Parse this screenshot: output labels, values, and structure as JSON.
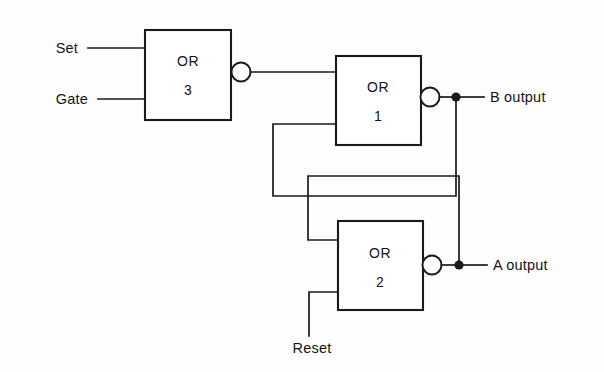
{
  "diagram": {
    "type": "logic-gate-schematic",
    "background_color": "#fefefe",
    "line_color": "#1a1a1a",
    "gates": [
      {
        "id": "or3",
        "label_line1": "OR",
        "label_line2": "3",
        "x": 145,
        "y": 30,
        "width": 86,
        "height": 90,
        "bubble_cx": 241,
        "bubble_cy": 72,
        "bubble_r": 9.5
      },
      {
        "id": "or1",
        "label_line1": "OR",
        "label_line2": "1",
        "x": 336,
        "y": 56,
        "width": 85,
        "height": 89,
        "bubble_cx": 430,
        "bubble_cy": 97,
        "bubble_r": 9.5
      },
      {
        "id": "or2",
        "label_line1": "OR",
        "label_line2": "2",
        "x": 338,
        "y": 221,
        "width": 85,
        "height": 89,
        "bubble_cx": 432,
        "bubble_cy": 265,
        "bubble_r": 9.5
      }
    ],
    "inputs": [
      {
        "id": "set",
        "label": "Set",
        "text_x": 78,
        "text_y": 53,
        "wire_y": 48,
        "wire_x_start": 88,
        "wire_x_end": 145
      },
      {
        "id": "gate",
        "label": "Gate",
        "text_x": 88,
        "text_y": 104,
        "wire_y": 99,
        "wire_x_start": 98,
        "wire_x_end": 145
      },
      {
        "id": "reset",
        "label": "Reset",
        "text_x": 312,
        "text_y": 353,
        "wire_x": 309,
        "wire_y_top": 292,
        "wire_y_bottom": 336
      }
    ],
    "outputs": [
      {
        "id": "b-output",
        "label": "B output",
        "text_x": 490,
        "text_y": 102,
        "dot_x": 456,
        "dot_y": 97,
        "wire_x_end": 484
      },
      {
        "id": "a-output",
        "label": "A output",
        "text_x": 493,
        "text_y": 270,
        "dot_x": 459,
        "dot_y": 265,
        "wire_x_end": 487
      }
    ],
    "junction_radius": 4.6,
    "feedback": {
      "b_to_or1_lower": {
        "from_x": 456,
        "from_y": 97,
        "down_y": 196,
        "left_x": 273,
        "up_y": 124,
        "to_x": 336
      },
      "a_to_or2_upper": {
        "from_x": 459,
        "from_y": 265,
        "up_y": 176,
        "left_x": 308,
        "down_y": 240,
        "to_x": 338
      },
      "or3_to_or1": {
        "from_x": 251,
        "from_y": 72,
        "to_x": 336
      }
    }
  }
}
